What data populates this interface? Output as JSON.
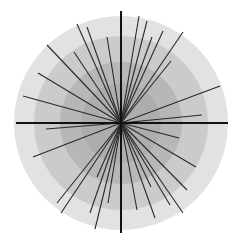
{
  "diagram": {
    "type": "radial-line-burst",
    "center": [
      121,
      123
    ],
    "rings": [
      {
        "r": 107,
        "color": "#e2e2e2"
      },
      {
        "r": 87,
        "color": "#cbcbcb"
      },
      {
        "r": 61,
        "color": "#b7b7b7"
      },
      {
        "r": 40,
        "color": "#adadad"
      }
    ],
    "axis_color": "#111111",
    "axes": {
      "horizontal": [
        16,
        123,
        228,
        123
      ],
      "vertical": [
        121,
        11,
        121,
        233
      ]
    },
    "line_color": "#2a2a2a",
    "line_endpoints": [
      [
        139,
        16
      ],
      [
        147,
        21
      ],
      [
        152,
        37
      ],
      [
        163,
        31
      ],
      [
        183,
        32
      ],
      [
        171,
        61
      ],
      [
        220,
        86
      ],
      [
        202,
        115
      ],
      [
        179,
        138
      ],
      [
        196,
        167
      ],
      [
        187,
        190
      ],
      [
        183,
        213
      ],
      [
        151,
        187
      ],
      [
        155,
        218
      ],
      [
        137,
        210
      ],
      [
        170,
        205
      ],
      [
        46,
        129
      ],
      [
        33,
        157
      ],
      [
        57,
        203
      ],
      [
        61,
        213
      ],
      [
        90,
        213
      ],
      [
        95,
        229
      ],
      [
        97,
        177
      ],
      [
        108,
        203
      ],
      [
        77,
        24
      ],
      [
        87,
        27
      ],
      [
        107,
        37
      ],
      [
        47,
        45
      ],
      [
        74,
        52
      ],
      [
        38,
        73
      ],
      [
        23,
        96
      ]
    ]
  }
}
